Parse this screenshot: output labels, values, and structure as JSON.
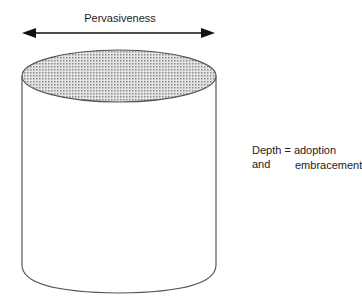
{
  "diagram": {
    "top_label": "Pervasiveness",
    "side_label_line1": "Depth = adoption and",
    "side_label_line2": "embracement",
    "colors": {
      "stroke": "#555555",
      "arrow": "#111111",
      "fill_pattern": "#9a9a9a"
    }
  }
}
